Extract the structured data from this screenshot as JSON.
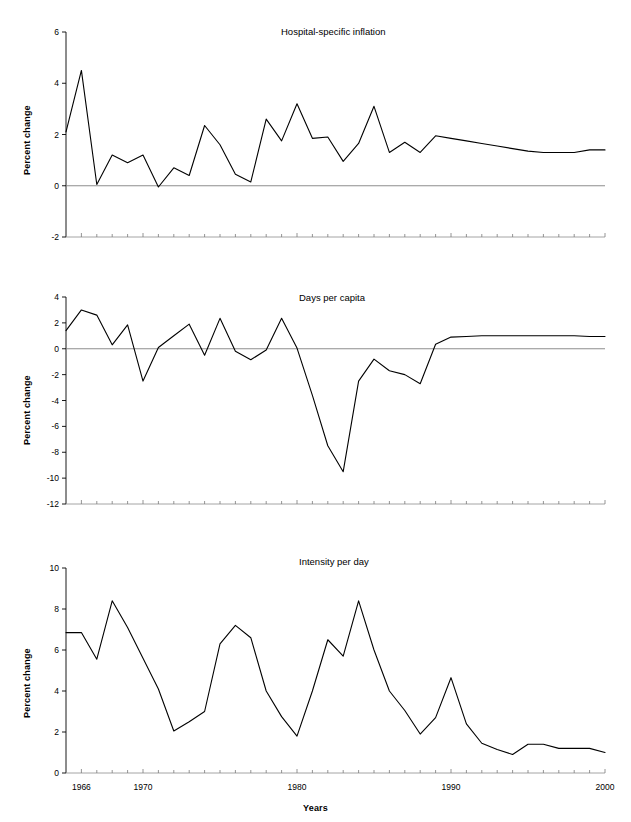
{
  "figure": {
    "xlabel": "Years",
    "ylabel": "Percent change",
    "x_tick_labels": [
      "1966",
      "1970",
      "1980",
      "1990",
      "2000"
    ],
    "x_tick_values": [
      1966,
      1970,
      1980,
      1990,
      2000
    ],
    "xlim": [
      1965,
      2000
    ],
    "x_minor_step": 1,
    "line_color": "#000000",
    "axis_color": "#000000",
    "zero_line_color": "#808080"
  },
  "chart_data": [
    {
      "type": "line",
      "title": "Hospital-specific inflation",
      "xlabel": "",
      "ylabel": "Percent change",
      "xlim": [
        1965,
        2000
      ],
      "ylim": [
        -2,
        6
      ],
      "y_ticks": [
        -2,
        0,
        2,
        4,
        6
      ],
      "y_tick_labels": [
        "-2",
        "0",
        "2",
        "4",
        "6"
      ],
      "grid": false,
      "legend": "none",
      "x": [
        1965,
        1966,
        1967,
        1968,
        1969,
        1970,
        1971,
        1972,
        1973,
        1974,
        1975,
        1976,
        1977,
        1978,
        1979,
        1980,
        1981,
        1982,
        1983,
        1984,
        1985,
        1986,
        1987,
        1988,
        1989,
        1990,
        1991,
        1992,
        1993,
        1994,
        1995,
        1996,
        1997,
        1998,
        1999,
        2000
      ],
      "values": [
        2.1,
        4.5,
        0.05,
        1.2,
        0.9,
        1.2,
        -0.05,
        0.7,
        0.4,
        2.35,
        1.6,
        0.45,
        0.15,
        2.6,
        1.75,
        3.2,
        1.85,
        1.9,
        0.95,
        1.65,
        3.1,
        1.3,
        1.7,
        1.3,
        1.95,
        1.85,
        1.75,
        1.65,
        1.55,
        1.45,
        1.35,
        1.3,
        1.3,
        1.3,
        1.4,
        1.4
      ]
    },
    {
      "type": "line",
      "title": "Days per capita",
      "xlabel": "",
      "ylabel": "Percent change",
      "xlim": [
        1965,
        2000
      ],
      "ylim": [
        -12,
        4
      ],
      "y_ticks": [
        -12,
        -10,
        -8,
        -6,
        -4,
        -2,
        0,
        2,
        4
      ],
      "y_tick_labels": [
        "-12",
        "-10",
        "-8",
        "-6",
        "-4",
        "-2",
        "0",
        "2",
        "4"
      ],
      "grid": false,
      "legend": "none",
      "x": [
        1965,
        1966,
        1967,
        1968,
        1969,
        1970,
        1971,
        1972,
        1973,
        1974,
        1975,
        1976,
        1977,
        1978,
        1979,
        1980,
        1981,
        1982,
        1983,
        1984,
        1985,
        1986,
        1987,
        1988,
        1989,
        1990,
        1991,
        1992,
        1993,
        1994,
        1995,
        1996,
        1997,
        1998,
        1999,
        2000
      ],
      "values": [
        1.4,
        3.0,
        2.6,
        0.3,
        1.85,
        -2.5,
        0.1,
        1.0,
        1.9,
        -0.5,
        2.35,
        -0.2,
        -0.85,
        -0.1,
        2.35,
        0.05,
        -3.6,
        -7.5,
        -9.5,
        -2.5,
        -0.8,
        -1.7,
        -2.0,
        -2.7,
        0.35,
        0.9,
        0.95,
        1.0,
        1.0,
        1.0,
        1.0,
        1.0,
        1.0,
        1.0,
        0.95,
        0.95
      ]
    },
    {
      "type": "line",
      "title": "Intensity per day",
      "xlabel": "Years",
      "ylabel": "Percent change",
      "xlim": [
        1965,
        2000
      ],
      "ylim": [
        0,
        10
      ],
      "y_ticks": [
        0,
        2,
        4,
        6,
        8,
        10
      ],
      "y_tick_labels": [
        "0",
        "2",
        "4",
        "6",
        "8",
        "10"
      ],
      "grid": false,
      "legend": "none",
      "x": [
        1965,
        1966,
        1967,
        1968,
        1969,
        1970,
        1971,
        1972,
        1973,
        1974,
        1975,
        1976,
        1977,
        1978,
        1979,
        1980,
        1981,
        1982,
        1983,
        1984,
        1985,
        1986,
        1987,
        1988,
        1989,
        1990,
        1991,
        1992,
        1993,
        1994,
        1995,
        1996,
        1997,
        1998,
        1999,
        2000
      ],
      "values": [
        6.85,
        6.85,
        5.55,
        8.4,
        7.1,
        5.6,
        4.1,
        2.05,
        2.5,
        3.0,
        6.3,
        7.2,
        6.6,
        4.0,
        2.75,
        1.8,
        4.0,
        6.5,
        5.7,
        8.4,
        6.0,
        4.0,
        3.05,
        1.9,
        2.7,
        4.65,
        2.4,
        1.45,
        1.15,
        0.9,
        1.4,
        1.4,
        1.2,
        1.2,
        1.2,
        1.0
      ]
    }
  ]
}
